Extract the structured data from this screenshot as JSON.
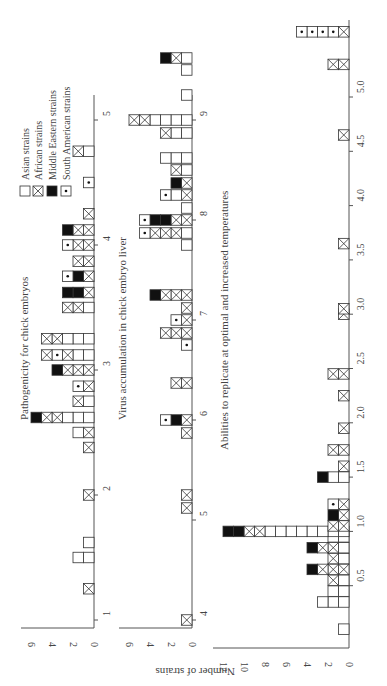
{
  "legend": {
    "items": [
      {
        "key": "a",
        "label": "Asian strains"
      },
      {
        "key": "x",
        "label": "African strains"
      },
      {
        "key": "m",
        "label": "Middle Eastern strains"
      },
      {
        "key": "s",
        "label": "South American strains"
      }
    ]
  },
  "ylabel": "Number of strains",
  "chart_data": [
    {
      "type": "bar",
      "title": "Pathogenicity for chick embryos",
      "xlabel": "",
      "ylabel": "Number of strains",
      "x_ticks": [
        "1",
        "2",
        "3",
        "4",
        "5"
      ],
      "y_ticks": [
        "0",
        "2",
        "4",
        "6"
      ],
      "ylim": [
        0,
        7
      ],
      "xlim": [
        1,
        5
      ],
      "stacks_note": "each stack lists cell types from count 1 upward; a=Asian, x=African, m=Middle Eastern, s=South American",
      "stacks": [
        {
          "x": 1.25,
          "cells": [
            "x"
          ]
        },
        {
          "x": 1.5,
          "cells": [
            "a",
            "a"
          ]
        },
        {
          "x": 1.62,
          "cells": [
            "a"
          ]
        },
        {
          "x": 2.0,
          "cells": [
            "x"
          ]
        },
        {
          "x": 2.38,
          "cells": [
            "x"
          ]
        },
        {
          "x": 2.5,
          "cells": [
            "x",
            "a"
          ]
        },
        {
          "x": 2.62,
          "cells": [
            "a",
            "a",
            "a",
            "x",
            "x",
            "m"
          ]
        },
        {
          "x": 2.75,
          "cells": [
            "a",
            "x"
          ]
        },
        {
          "x": 2.87,
          "cells": [
            "x",
            "s"
          ]
        },
        {
          "x": 3.0,
          "cells": [
            "x",
            "x",
            "x",
            "m"
          ]
        },
        {
          "x": 3.12,
          "cells": [
            "a",
            "a",
            "x",
            "s",
            "x"
          ]
        },
        {
          "x": 3.25,
          "cells": [
            "a",
            "a",
            "a",
            "x",
            "x"
          ]
        },
        {
          "x": 3.5,
          "cells": [
            "a",
            "x",
            "x"
          ]
        },
        {
          "x": 3.62,
          "cells": [
            "x",
            "m",
            "m"
          ]
        },
        {
          "x": 3.75,
          "cells": [
            "x",
            "m",
            "s"
          ]
        },
        {
          "x": 3.87,
          "cells": [
            "x",
            "x"
          ]
        },
        {
          "x": 4.0,
          "cells": [
            "x",
            "x",
            "s"
          ]
        },
        {
          "x": 4.12,
          "cells": [
            "x",
            "x",
            "m"
          ]
        },
        {
          "x": 4.25,
          "cells": [
            "x"
          ]
        },
        {
          "x": 4.5,
          "cells": [
            "s"
          ]
        },
        {
          "x": 4.75,
          "cells": [
            "a",
            "x"
          ]
        }
      ]
    },
    {
      "type": "bar",
      "title": "Virus accumulation in chick embryo liver",
      "xlabel": "",
      "ylabel": "Number of strains",
      "x_ticks": [
        "4",
        "5",
        "6",
        "7",
        "8",
        "9"
      ],
      "y_ticks": [
        "0",
        "2",
        "4",
        "6"
      ],
      "ylim": [
        0,
        7
      ],
      "xlim": [
        4,
        9
      ],
      "stacks": [
        {
          "x": 4.0,
          "cells": [
            "x"
          ]
        },
        {
          "x": 5.12,
          "cells": [
            "x"
          ]
        },
        {
          "x": 5.25,
          "cells": [
            "x"
          ]
        },
        {
          "x": 5.87,
          "cells": [
            "x"
          ]
        },
        {
          "x": 6.0,
          "cells": [
            "x",
            "m",
            "s"
          ]
        },
        {
          "x": 6.37,
          "cells": [
            "x",
            "x"
          ]
        },
        {
          "x": 6.75,
          "cells": [
            "s"
          ]
        },
        {
          "x": 6.87,
          "cells": [
            "x",
            "x",
            "x"
          ]
        },
        {
          "x": 7.0,
          "cells": [
            "x",
            "s"
          ]
        },
        {
          "x": 7.12,
          "cells": [
            "x"
          ]
        },
        {
          "x": 7.25,
          "cells": [
            "x",
            "x",
            "x",
            "m"
          ]
        },
        {
          "x": 7.75,
          "cells": [
            "a"
          ]
        },
        {
          "x": 7.87,
          "cells": [
            "a",
            "x",
            "x",
            "x",
            "s"
          ]
        },
        {
          "x": 8.0,
          "cells": [
            "x",
            "x",
            "m",
            "m",
            "s"
          ]
        },
        {
          "x": 8.12,
          "cells": [
            "a"
          ]
        },
        {
          "x": 8.25,
          "cells": [
            "x",
            "a",
            "s"
          ]
        },
        {
          "x": 8.37,
          "cells": [
            "x",
            "m"
          ]
        },
        {
          "x": 8.5,
          "cells": [
            "a",
            "x"
          ]
        },
        {
          "x": 8.62,
          "cells": [
            "a",
            "a",
            "a"
          ]
        },
        {
          "x": 8.87,
          "cells": [
            "a",
            "a",
            "x"
          ]
        },
        {
          "x": 9.0,
          "cells": [
            "a",
            "a",
            "a",
            "a",
            "x",
            "x"
          ]
        },
        {
          "x": 9.25,
          "cells": [
            "a"
          ]
        },
        {
          "x": 9.5,
          "cells": [
            "a"
          ]
        },
        {
          "x": 9.62,
          "cells": [
            "a",
            "x",
            "m"
          ]
        }
      ]
    },
    {
      "type": "bar",
      "title": "Abilities to replicate at optimal and increased temperatures",
      "xlabel": "",
      "ylabel": "Number of strains",
      "x_ticks": [
        "0.5",
        "1.0",
        "1.5",
        "2.0",
        "2.5",
        "3.0",
        "3.5",
        "4.0",
        "4.5",
        "5.0",
        ">5.0",
        "No repli-cation"
      ],
      "y_ticks": [
        "0",
        "2",
        "4",
        "6",
        "8",
        "10",
        "12"
      ],
      "ylim": [
        0,
        12
      ],
      "stacks": [
        {
          "x": 0.1,
          "cells": [
            "a"
          ]
        },
        {
          "x": 0.35,
          "cells": [
            "a",
            "a",
            "a"
          ]
        },
        {
          "x": 0.45,
          "cells": [
            "a",
            "a"
          ]
        },
        {
          "x": 0.55,
          "cells": [
            "a",
            "x"
          ]
        },
        {
          "x": 0.65,
          "cells": [
            "x",
            "x",
            "x",
            "m"
          ]
        },
        {
          "x": 0.75,
          "cells": [
            "a",
            "x"
          ]
        },
        {
          "x": 0.85,
          "cells": [
            "a",
            "x",
            "x",
            "m"
          ]
        },
        {
          "x": 0.95,
          "cells": [
            "a",
            "a"
          ]
        },
        {
          "x": 1.0,
          "cells": [
            "a",
            "a",
            "a",
            "a",
            "a",
            "a",
            "a",
            "a",
            "x",
            "x",
            "m",
            "m"
          ]
        },
        {
          "x": 1.05,
          "cells": [
            "x",
            "x"
          ]
        },
        {
          "x": 1.15,
          "cells": [
            "x",
            "m"
          ]
        },
        {
          "x": 1.25,
          "cells": [
            "x",
            "s"
          ]
        },
        {
          "x": 1.5,
          "cells": [
            "a",
            "a",
            "m"
          ]
        },
        {
          "x": 1.6,
          "cells": [
            "x"
          ]
        },
        {
          "x": 1.75,
          "cells": [
            "x",
            "x"
          ]
        },
        {
          "x": 1.95,
          "cells": [
            "x"
          ]
        },
        {
          "x": 2.25,
          "cells": [
            "x"
          ]
        },
        {
          "x": 2.45,
          "cells": [
            "x",
            "x"
          ]
        },
        {
          "x": 3.0,
          "cells": [
            "x"
          ]
        },
        {
          "x": 3.05,
          "cells": [
            "x"
          ]
        },
        {
          "x": 3.65,
          "cells": [
            "x"
          ]
        },
        {
          "x": 4.65,
          "cells": [
            "x"
          ]
        },
        {
          "x": 5.3,
          "cells": [
            "x",
            "x"
          ]
        },
        {
          "x": 5.6,
          "cells": [
            "x",
            "s",
            "s",
            "s",
            "s"
          ]
        }
      ]
    }
  ]
}
